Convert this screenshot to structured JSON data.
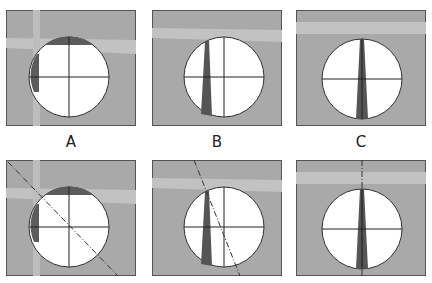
{
  "figure": {
    "labels": [
      "A",
      "B",
      "C"
    ],
    "colors": {
      "background": "#a9a9a9",
      "road_band": "#c4c4c4",
      "circle_fill": "#ffffff",
      "shadow": "#5a5a5a",
      "line": "#222222"
    },
    "panels": [
      {
        "id": "A-top",
        "row": 1,
        "label": "A",
        "dashed_line": false
      },
      {
        "id": "B-top",
        "row": 1,
        "label": "B",
        "dashed_line": false
      },
      {
        "id": "C-top",
        "row": 1,
        "label": "C",
        "dashed_line": false
      },
      {
        "id": "A-bottom",
        "row": 2,
        "label": "A",
        "dashed_line": true
      },
      {
        "id": "B-bottom",
        "row": 2,
        "label": "B",
        "dashed_line": true
      },
      {
        "id": "C-bottom",
        "row": 2,
        "label": "C",
        "dashed_line": true
      }
    ]
  }
}
